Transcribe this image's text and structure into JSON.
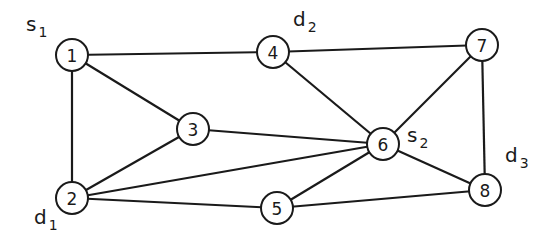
{
  "graph": {
    "nodes": [
      {
        "id": "1",
        "label": "1"
      },
      {
        "id": "2",
        "label": "2"
      },
      {
        "id": "3",
        "label": "3"
      },
      {
        "id": "4",
        "label": "4"
      },
      {
        "id": "5",
        "label": "5"
      },
      {
        "id": "6",
        "label": "6"
      },
      {
        "id": "7",
        "label": "7"
      },
      {
        "id": "8",
        "label": "8"
      }
    ],
    "edges": [
      [
        "1",
        "4"
      ],
      [
        "4",
        "7"
      ],
      [
        "1",
        "3"
      ],
      [
        "1",
        "2"
      ],
      [
        "4",
        "6"
      ],
      [
        "7",
        "6"
      ],
      [
        "7",
        "8"
      ],
      [
        "3",
        "6"
      ],
      [
        "3",
        "2"
      ],
      [
        "2",
        "6"
      ],
      [
        "2",
        "5"
      ],
      [
        "5",
        "6"
      ],
      [
        "5",
        "8"
      ],
      [
        "6",
        "8"
      ]
    ],
    "annotations": [
      {
        "node": "1",
        "base": "s",
        "sub": "1"
      },
      {
        "node": "4",
        "base": "d",
        "sub": "2"
      },
      {
        "node": "6",
        "base": "s",
        "sub": "2"
      },
      {
        "node": "8",
        "base": "d",
        "sub": "3"
      },
      {
        "node": "2",
        "base": "d",
        "sub": "1"
      }
    ]
  }
}
